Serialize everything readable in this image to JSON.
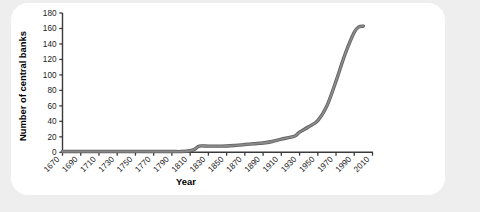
{
  "card": {
    "background_color": "#ffffff",
    "page_background_color": "#eeeeee"
  },
  "chart_data": {
    "type": "line",
    "title": "",
    "xlabel": "Year",
    "ylabel": "Number of central banks",
    "xlim": [
      1670,
      2010
    ],
    "ylim": [
      0,
      180
    ],
    "grid": false,
    "legend": "none",
    "line_color": "#8a8a8a",
    "line_edge_color": "#5d5d5d",
    "axis_color": "#3a3a3a",
    "xticks": [
      1670,
      1690,
      1710,
      1730,
      1750,
      1770,
      1790,
      1810,
      1830,
      1850,
      1870,
      1890,
      1910,
      1930,
      1950,
      1970,
      1990,
      2010
    ],
    "xtick_labels": [
      "1670",
      "1690",
      "1710",
      "1730",
      "1750",
      "1770",
      "1790",
      "1810",
      "1830",
      "1850",
      "1870",
      "1890",
      "1910",
      "1930",
      "1950",
      "1970",
      "1990",
      "2010"
    ],
    "yticks": [
      0,
      20,
      40,
      60,
      80,
      100,
      120,
      140,
      160,
      180
    ],
    "ytick_labels": [
      "0",
      "20",
      "40",
      "60",
      "80",
      "100",
      "120",
      "140",
      "160",
      "180"
    ],
    "series": [
      {
        "name": "Number of central banks",
        "x": [
          1670,
          1690,
          1710,
          1730,
          1750,
          1770,
          1790,
          1800,
          1810,
          1815,
          1820,
          1830,
          1845,
          1860,
          1870,
          1880,
          1890,
          1900,
          1910,
          1918,
          1925,
          1930,
          1940,
          1950,
          1960,
          1970,
          1980,
          1990,
          1995,
          2000
        ],
        "values": [
          1,
          1,
          1,
          1,
          1,
          1,
          1,
          1,
          2,
          4,
          8,
          8,
          8,
          9,
          10,
          11,
          12,
          14,
          17,
          19,
          21,
          26,
          33,
          41,
          60,
          92,
          127,
          155,
          162,
          163
        ]
      }
    ]
  }
}
